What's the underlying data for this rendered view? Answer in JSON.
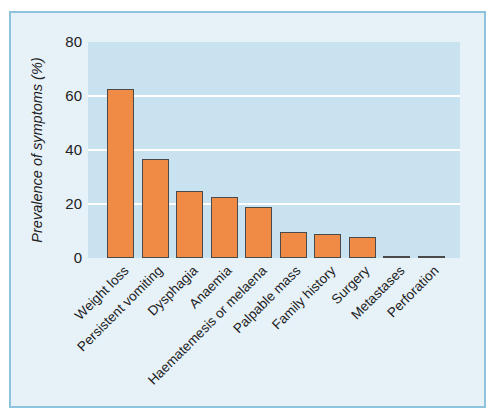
{
  "chart_data": {
    "type": "bar",
    "title": "",
    "ylabel": "Prevalence of symptoms (%)",
    "xlabel": "",
    "categories": [
      "Weight loss",
      "Persistent vomiting",
      "Dysphagia",
      "Anaemia",
      "Haematemesis or melaena",
      "Palpable mass",
      "Family history",
      "Surgery",
      "Metastases",
      "Perforation"
    ],
    "values": [
      62,
      36,
      24,
      22,
      18,
      9,
      8,
      7,
      0,
      0
    ],
    "ylim": [
      0,
      80
    ],
    "yticks": [
      0,
      20,
      40,
      60,
      80
    ],
    "grid": true,
    "gridline_values": [
      20,
      40,
      60
    ],
    "legend": "none",
    "colors": {
      "bar_fill": "#ef8b45",
      "bar_edge": "#4a4a4a",
      "plot_background": "#c8e2f0",
      "figure_background": "#e7f1f8",
      "figure_border": "#8ec3de",
      "gridline": "#ffffff",
      "text": "#222222",
      "page_background": "#ffffff"
    }
  }
}
